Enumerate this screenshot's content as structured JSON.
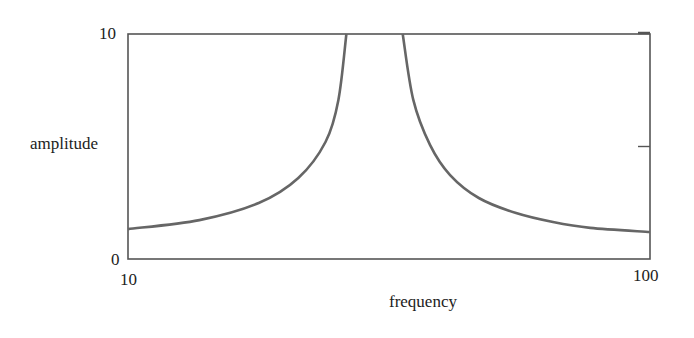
{
  "chart_data": {
    "type": "line",
    "title": "",
    "xlabel": "frequency",
    "ylabel": "amplitude",
    "xscale": "log",
    "xlim": [
      10,
      100
    ],
    "ylim": [
      0,
      10
    ],
    "x_tick_labels": [
      "10",
      "100"
    ],
    "y_tick_labels": [
      "0",
      "10"
    ],
    "right_axis_tick_at": 5,
    "grid": false,
    "legend": null,
    "line_color": "#666666",
    "series": [
      {
        "name": "amplitude",
        "segments": [
          {
            "x": [
              10.0,
              13.7,
              17.8,
              21.2,
              23.9,
              25.3,
              26.2
            ],
            "y": [
              1.33,
              1.73,
              2.49,
              3.6,
              5.2,
              7.07,
              10.0
            ]
          },
          {
            "x": [
              33.6,
              35.2,
              37.9,
              41.4,
              47.0,
              55.4,
              65.2,
              76.8,
              100.0
            ],
            "y": [
              10.0,
              7.07,
              5.07,
              3.73,
              2.71,
              2.04,
              1.64,
              1.38,
              1.2
            ]
          }
        ]
      }
    ]
  }
}
